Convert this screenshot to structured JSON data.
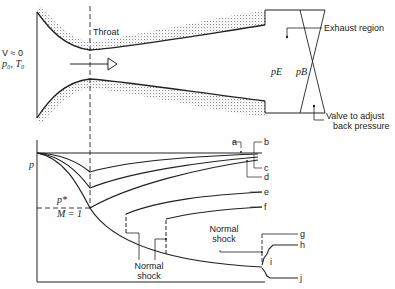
{
  "nozzle": {
    "inlet_velocity": "V ≈ 0",
    "inlet_state": "p₀, T₀",
    "throat_label": "Throat",
    "exit_pressure": "pE",
    "back_pressure": "pB",
    "exhaust_label": "Exhaust region",
    "valve_label_line1": "Valve to adjust",
    "valve_label_line2": "back pressure",
    "flow_arrow": "flow-direction-arrow"
  },
  "plot": {
    "y_axis_label": "p",
    "critical_pressure": "p*",
    "mach_label": "M = 1",
    "curve_labels": [
      "a",
      "b",
      "c",
      "d",
      "e",
      "f",
      "g",
      "h",
      "i",
      "j"
    ],
    "shock_label_1_line1": "Normal",
    "shock_label_1_line2": "shock",
    "shock_label_2_line1": "Normal",
    "shock_label_2_line2": "shock"
  },
  "colors": {
    "line": "#222222",
    "stipple": "#9a9a9a",
    "background": "#ffffff"
  }
}
